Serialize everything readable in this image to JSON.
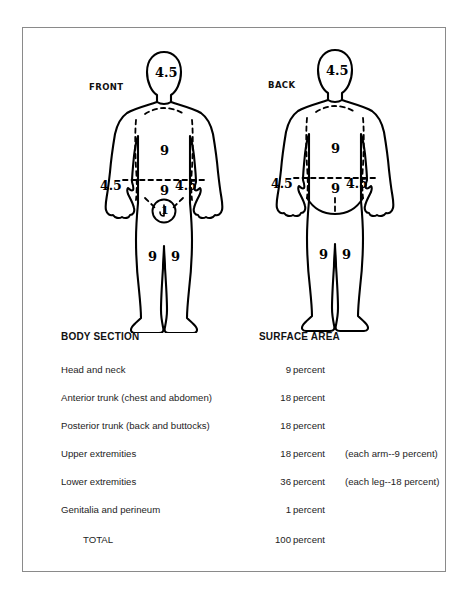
{
  "document": {
    "type": "rule-of-nines-burn-chart"
  },
  "figures": {
    "front": {
      "label": "FRONT",
      "marks": [
        {
          "id": "head",
          "value": "4.5"
        },
        {
          "id": "chest",
          "value": "9"
        },
        {
          "id": "abdomen",
          "value": "9"
        },
        {
          "id": "arm-left",
          "value": "4.5"
        },
        {
          "id": "arm-right",
          "value": "4.5"
        },
        {
          "id": "genitalia",
          "value": "1"
        },
        {
          "id": "leg-left",
          "value": "9"
        },
        {
          "id": "leg-right",
          "value": "9"
        }
      ]
    },
    "back": {
      "label": "BACK",
      "marks": [
        {
          "id": "head",
          "value": "4.5"
        },
        {
          "id": "upper-back",
          "value": "9"
        },
        {
          "id": "lower-back",
          "value": "9"
        },
        {
          "id": "arm-left",
          "value": "4.5"
        },
        {
          "id": "arm-right",
          "value": "4.5"
        },
        {
          "id": "leg-left",
          "value": "9"
        },
        {
          "id": "leg-right",
          "value": "9"
        }
      ]
    }
  },
  "table": {
    "headers": {
      "section": "BODY SECTION",
      "area": "SURFACE AREA"
    },
    "rows": [
      {
        "section": "Head and neck",
        "amount": "9",
        "unit": "percent",
        "note": ""
      },
      {
        "section": "Anterior trunk (chest and abdomen)",
        "amount": "18",
        "unit": "percent",
        "note": ""
      },
      {
        "section": "Posterior trunk (back and buttocks)",
        "amount": "18",
        "unit": "percent",
        "note": ""
      },
      {
        "section": "Upper extremities",
        "amount": "18",
        "unit": "percent",
        "note": "(each arm--9 percent)"
      },
      {
        "section": "Lower extremities",
        "amount": "36",
        "unit": "percent",
        "note": "(each leg--18 percent)"
      },
      {
        "section": "Genitalia and perineum",
        "amount": "1",
        "unit": "percent",
        "note": ""
      }
    ],
    "total": {
      "section": "TOTAL",
      "amount": "100",
      "unit": "percent",
      "note": ""
    }
  },
  "colors": {
    "ink": "#000000",
    "frame": "#8a8a8a",
    "page": "#ffffff"
  }
}
